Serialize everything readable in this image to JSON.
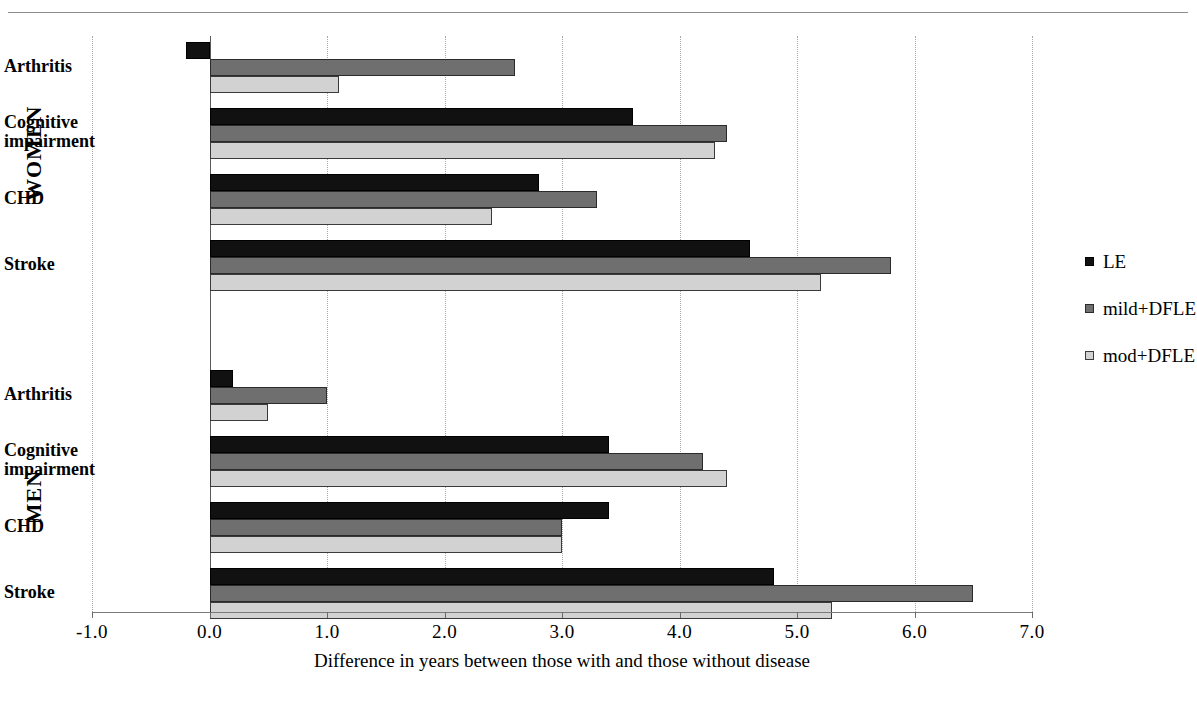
{
  "chart_data": {
    "type": "bar",
    "orientation": "horizontal",
    "title": "",
    "xlabel": "Difference in years between those with and those without disease",
    "ylabel": "",
    "xlim": [
      -1.0,
      7.0
    ],
    "xticks": [
      "-1.0",
      "0.0",
      "1.0",
      "2.0",
      "3.0",
      "4.0",
      "5.0",
      "6.0",
      "7.0"
    ],
    "xtick_values": [
      -1.0,
      0.0,
      1.0,
      2.0,
      3.0,
      4.0,
      5.0,
      6.0,
      7.0
    ],
    "grid": true,
    "grid_axis": "x",
    "legend_position": "right",
    "series": [
      {
        "name": "LE",
        "color": "#111111"
      },
      {
        "name": "mild+DFLE",
        "color": "#6f6f6f"
      },
      {
        "name": "mod+DFLE",
        "color": "#d2d2d2"
      }
    ],
    "groups": [
      {
        "name": "WOMEN",
        "categories": [
          "Arthritis",
          "Cognitive impairment",
          "CHD",
          "Stroke"
        ],
        "values": {
          "LE": [
            -0.2,
            3.6,
            2.8,
            4.6
          ],
          "mild+DFLE": [
            2.6,
            4.4,
            3.3,
            5.8
          ],
          "mod+DFLE": [
            1.1,
            4.3,
            2.4,
            5.2
          ]
        }
      },
      {
        "name": "MEN",
        "categories": [
          "Arthritis",
          "Cognitive impairment",
          "CHD",
          "Stroke"
        ],
        "values": {
          "LE": [
            0.2,
            3.4,
            3.4,
            4.8
          ],
          "mild+DFLE": [
            1.0,
            4.2,
            3.0,
            6.5
          ],
          "mod+DFLE": [
            0.5,
            4.4,
            3.0,
            5.3
          ]
        }
      }
    ]
  },
  "legend": {
    "items": [
      {
        "label": "LE"
      },
      {
        "label": "mild+DFLE"
      },
      {
        "label": "mod+DFLE"
      }
    ]
  },
  "axis": {
    "x_title": "Difference in years between those with and those without disease",
    "ticks": [
      "-1.0",
      "0.0",
      "1.0",
      "2.0",
      "3.0",
      "4.0",
      "5.0",
      "6.0",
      "7.0"
    ]
  },
  "groups": [
    {
      "label": "WOMEN"
    },
    {
      "label": "MEN"
    }
  ],
  "categories": {
    "women": [
      {
        "label": "Arthritis"
      },
      {
        "label": "Cognitive impairment"
      },
      {
        "label": "CHD"
      },
      {
        "label": "Stroke"
      }
    ],
    "men": [
      {
        "label": "Arthritis"
      },
      {
        "label": "Cognitive impairment"
      },
      {
        "label": "CHD"
      },
      {
        "label": "Stroke"
      }
    ]
  }
}
